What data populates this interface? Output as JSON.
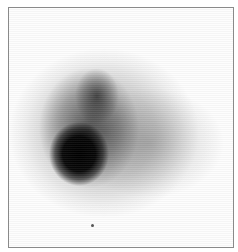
{
  "image": {
    "description": "Grayscale diffuse blob image with a dark core in the lower-left and a fainter halo extending to the right, enclosed in a thin gray border",
    "colors": {
      "border": "#8a8a8a",
      "background": "#fdfdfd",
      "core": "#000000"
    },
    "features": [
      {
        "name": "dark-core",
        "cx": 78,
        "cy": 153
      },
      {
        "name": "upper-lobe",
        "cx": 96,
        "cy": 95
      },
      {
        "name": "diffuse-halo",
        "cx": 103,
        "cy": 132
      },
      {
        "name": "speck",
        "cx": 91,
        "cy": 224
      }
    ]
  }
}
